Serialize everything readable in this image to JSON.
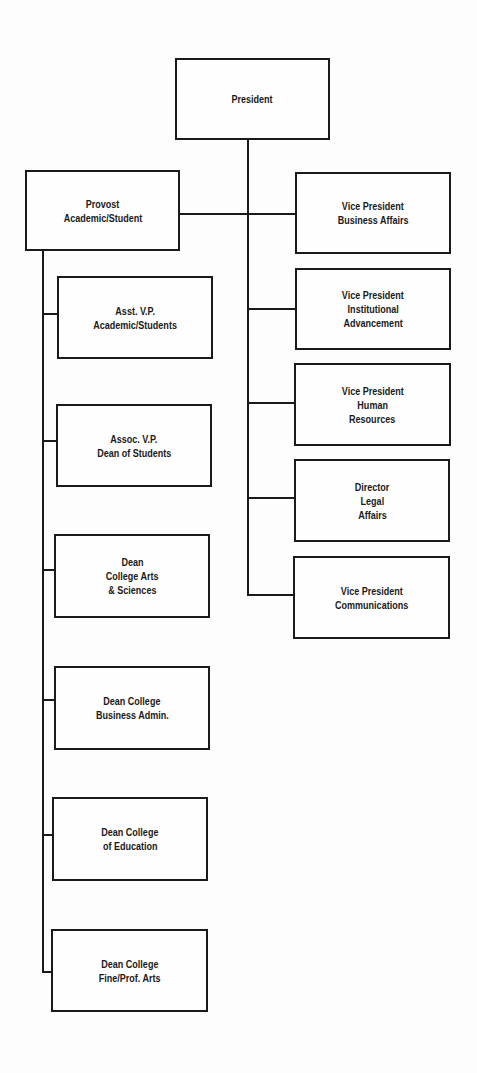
{
  "chart": {
    "type": "org-chart",
    "root": {
      "id": "president",
      "lines": [
        "President"
      ]
    },
    "provost": {
      "id": "provost",
      "lines": [
        "Provost",
        "Academic/Student"
      ]
    },
    "right_column": [
      {
        "id": "vp-business-affairs",
        "lines": [
          "Vice President",
          "Business Affairs"
        ]
      },
      {
        "id": "vp-institutional-advancement",
        "lines": [
          "Vice President",
          "Institutional",
          "Advancement"
        ]
      },
      {
        "id": "vp-human-resources",
        "lines": [
          "Vice President",
          "Human",
          "Resources"
        ]
      },
      {
        "id": "director-legal-affairs",
        "lines": [
          "Director",
          "Legal",
          "Affairs"
        ]
      },
      {
        "id": "vp-communications",
        "lines": [
          "Vice President",
          "Communications"
        ]
      }
    ],
    "left_column": [
      {
        "id": "asst-vp-academic-students",
        "lines": [
          "Asst. V.P.",
          "Academic/Students"
        ]
      },
      {
        "id": "assoc-vp-dean-of-students",
        "lines": [
          "Assoc. V.P.",
          "Dean of Students"
        ]
      },
      {
        "id": "dean-arts-sciences",
        "lines": [
          "Dean",
          "College Arts",
          "& Sciences"
        ]
      },
      {
        "id": "dean-business-admin",
        "lines": [
          "Dean College",
          "Business Admin."
        ]
      },
      {
        "id": "dean-education",
        "lines": [
          "Dean College",
          "of Education"
        ]
      },
      {
        "id": "dean-fine-prof-arts",
        "lines": [
          "Dean College",
          "Fine/Prof. Arts"
        ]
      }
    ]
  }
}
